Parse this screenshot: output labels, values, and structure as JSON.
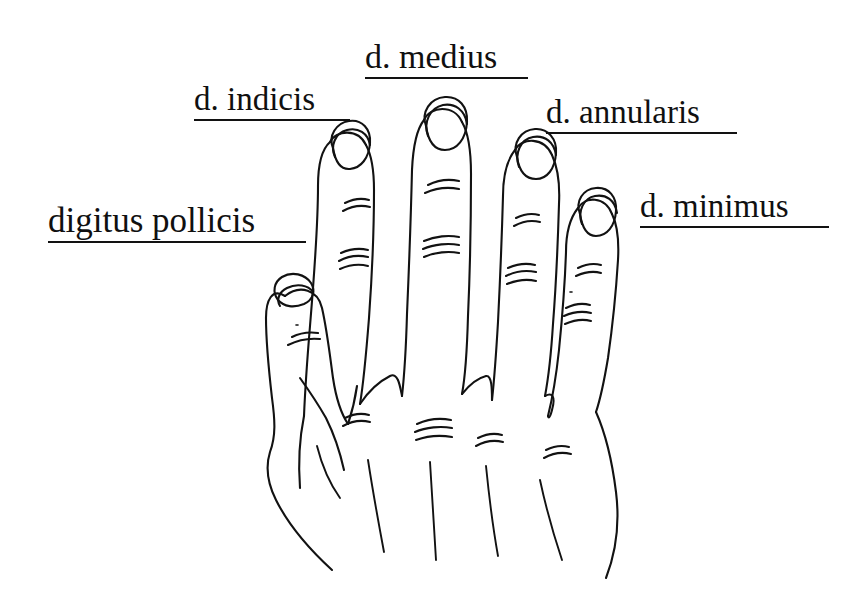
{
  "page": {
    "width": 864,
    "height": 605,
    "background_color": "#ffffff",
    "ink_color": "#101010"
  },
  "labels": {
    "thumb": {
      "text": "digitus pollicis",
      "underlined": true
    },
    "index": {
      "text": "d. indicis",
      "underlined": true
    },
    "middle": {
      "text": "d. medius",
      "underlined": true
    },
    "ring": {
      "text": "d. annularis",
      "underlined": true
    },
    "little": {
      "text": "d. minimus",
      "underlined": true
    }
  },
  "figure": {
    "name": "hand-line-drawing",
    "view": "dorsal",
    "digits": [
      {
        "name": "digitus pollicis",
        "has_nail": true,
        "crease_marks": 2
      },
      {
        "name": "digitus indicis",
        "has_nail": true,
        "crease_marks": 2
      },
      {
        "name": "digitus medius",
        "has_nail": true,
        "crease_marks": 2
      },
      {
        "name": "digitus annularis",
        "has_nail": true,
        "crease_marks": 2
      },
      {
        "name": "digitus minimus",
        "has_nail": true,
        "crease_marks": 3
      }
    ],
    "knuckle_creases": 4,
    "tendon_lines": 5
  }
}
